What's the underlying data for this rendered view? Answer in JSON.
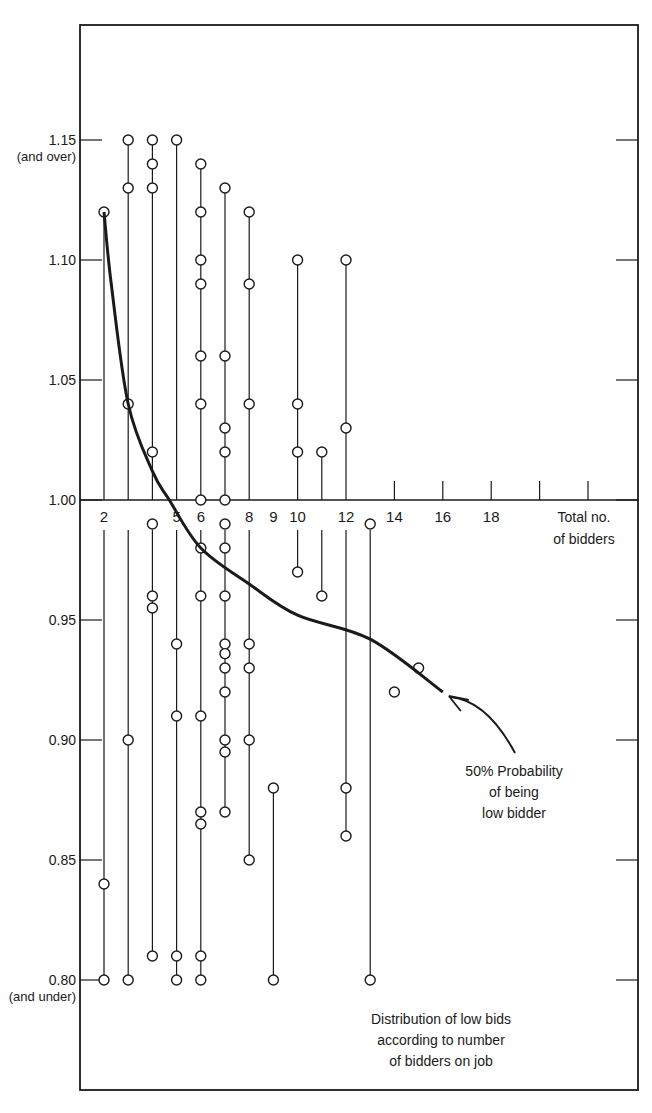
{
  "chart_data": {
    "type": "scatter",
    "xlabel": "Total no. of bidders",
    "ylabel": "",
    "x_tick_labels": [
      "2",
      "5",
      "6",
      "8",
      "9",
      "10",
      "12",
      "14",
      "16",
      "18"
    ],
    "x_tick_positions": [
      2,
      5,
      6,
      8,
      9,
      10,
      12,
      14,
      16,
      18
    ],
    "x_unlabeled_ticks": [
      3,
      4,
      7,
      11,
      13,
      20,
      22
    ],
    "y_ticks": [
      {
        "value": 1.15,
        "label": "1.15",
        "sublabel": "(and over)"
      },
      {
        "value": 1.1,
        "label": "1.10",
        "sublabel": ""
      },
      {
        "value": 1.05,
        "label": "1.05",
        "sublabel": ""
      },
      {
        "value": 1.0,
        "label": "1.00",
        "sublabel": ""
      },
      {
        "value": 0.95,
        "label": "0.95",
        "sublabel": ""
      },
      {
        "value": 0.9,
        "label": "0.90",
        "sublabel": ""
      },
      {
        "value": 0.85,
        "label": "0.85",
        "sublabel": ""
      },
      {
        "value": 0.8,
        "label": "0.80",
        "sublabel": "(and under)"
      }
    ],
    "ylim": [
      0.8,
      1.15
    ],
    "xlim": [
      2,
      22
    ],
    "grid": false,
    "series": [
      {
        "name": "Low bids (range lines per bidder count)",
        "columns": [
          {
            "x": 2,
            "range": [
              0.8,
              1.12
            ],
            "points": [
              1.12,
              0.84,
              0.8
            ]
          },
          {
            "x": 3,
            "range": [
              0.8,
              1.15
            ],
            "points": [
              1.15,
              1.13,
              1.04,
              0.9,
              0.8
            ]
          },
          {
            "x": 4,
            "range": [
              0.81,
              1.15
            ],
            "points": [
              1.15,
              1.14,
              1.13,
              1.02,
              0.99,
              0.96,
              0.955,
              0.81
            ]
          },
          {
            "x": 5,
            "range": [
              0.8,
              1.15
            ],
            "points": [
              1.15,
              0.94,
              0.91,
              0.81,
              0.8
            ]
          },
          {
            "x": 6,
            "range": [
              0.8,
              1.14
            ],
            "points": [
              1.14,
              1.12,
              1.1,
              1.09,
              1.06,
              1.04,
              1.0,
              0.98,
              0.96,
              0.91,
              0.87,
              0.865,
              0.81,
              0.8
            ]
          },
          {
            "x": 7,
            "range": [
              0.87,
              1.13
            ],
            "points": [
              1.13,
              1.06,
              1.03,
              1.02,
              1.0,
              0.99,
              0.98,
              0.96,
              0.94,
              0.936,
              0.93,
              0.92,
              0.9,
              0.895,
              0.87
            ]
          },
          {
            "x": 8,
            "range": [
              0.85,
              1.12
            ],
            "points": [
              1.12,
              1.09,
              1.04,
              0.94,
              0.93,
              0.9,
              0.85
            ]
          },
          {
            "x": 9,
            "range": [
              0.8,
              0.88
            ],
            "points": [
              0.88,
              0.8
            ]
          },
          {
            "x": 10,
            "range": [
              0.97,
              1.1
            ],
            "points": [
              1.1,
              1.04,
              1.02,
              0.97
            ]
          },
          {
            "x": 11,
            "range": [
              0.96,
              1.02
            ],
            "points": [
              1.02,
              0.96
            ]
          },
          {
            "x": 12,
            "range": [
              0.86,
              1.1
            ],
            "points": [
              1.1,
              1.03,
              0.88,
              0.86
            ]
          },
          {
            "x": 13,
            "range": [
              0.8,
              0.99
            ],
            "points": [
              0.99,
              0.8
            ]
          },
          {
            "x": 14,
            "range": null,
            "points": [
              0.92
            ]
          },
          {
            "x": 15,
            "range": null,
            "points": [
              0.93
            ]
          }
        ]
      },
      {
        "name": "50% Probability of being low bidder",
        "type": "line",
        "x": [
          2,
          2.3,
          3,
          4,
          4.7,
          6,
          8,
          10,
          13,
          16
        ],
        "y": [
          1.12,
          1.09,
          1.04,
          1.012,
          1.0,
          0.98,
          0.965,
          0.952,
          0.942,
          0.92
        ]
      }
    ],
    "annotations": [
      {
        "text_lines": [
          "50% Probability",
          "of being",
          "low bidder"
        ],
        "arrow_to": "end of curve"
      },
      {
        "text_lines": [
          "Distribution of low bids",
          "according to number",
          "of bidders on job"
        ]
      }
    ],
    "axis_title_lines": [
      "Total no.",
      "of bidders"
    ]
  }
}
